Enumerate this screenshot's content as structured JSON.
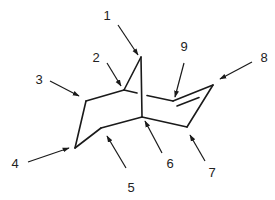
{
  "diagram": {
    "type": "chemical-structure",
    "colors": {
      "line": "#1a1a1a",
      "text": "#222222",
      "background": "#ffffff"
    },
    "atoms": [
      {
        "id": "C1",
        "x": 141,
        "y": 57
      },
      {
        "id": "C2",
        "x": 124,
        "y": 90
      },
      {
        "id": "C3",
        "x": 86,
        "y": 101
      },
      {
        "id": "C4",
        "x": 75,
        "y": 148
      },
      {
        "id": "C5",
        "x": 101,
        "y": 128
      },
      {
        "id": "C6",
        "x": 142,
        "y": 117
      },
      {
        "id": "C7",
        "x": 187,
        "y": 127
      },
      {
        "id": "C8",
        "x": 213,
        "y": 85
      },
      {
        "id": "C9",
        "x": 173,
        "y": 101
      }
    ],
    "labels": [
      {
        "text": "1",
        "x": 107,
        "y": 15,
        "arrow": {
          "x1": 118,
          "y1": 25,
          "x2": 138,
          "y2": 55
        }
      },
      {
        "text": "2",
        "x": 96,
        "y": 57,
        "arrow": {
          "x1": 107,
          "y1": 63,
          "x2": 121,
          "y2": 86
        }
      },
      {
        "text": "3",
        "x": 39,
        "y": 79,
        "arrow": {
          "x1": 50,
          "y1": 81,
          "x2": 79,
          "y2": 96
        }
      },
      {
        "text": "4",
        "x": 15,
        "y": 163,
        "arrow": {
          "x1": 28,
          "y1": 162,
          "x2": 69,
          "y2": 148
        }
      },
      {
        "text": "5",
        "x": 131,
        "y": 187,
        "arrow": {
          "x1": 126,
          "y1": 168,
          "x2": 107,
          "y2": 136
        }
      },
      {
        "text": "6",
        "x": 170,
        "y": 163,
        "arrow": {
          "x1": 162,
          "y1": 153,
          "x2": 145,
          "y2": 121
        }
      },
      {
        "text": "7",
        "x": 212,
        "y": 172,
        "arrow": {
          "x1": 205,
          "y1": 161,
          "x2": 190,
          "y2": 135
        }
      },
      {
        "text": "8",
        "x": 264,
        "y": 57,
        "arrow": {
          "x1": 252,
          "y1": 62,
          "x2": 220,
          "y2": 79
        }
      },
      {
        "text": "9",
        "x": 184,
        "y": 46,
        "arrow": {
          "x1": 184,
          "y1": 63,
          "x2": 175,
          "y2": 97
        }
      }
    ]
  }
}
